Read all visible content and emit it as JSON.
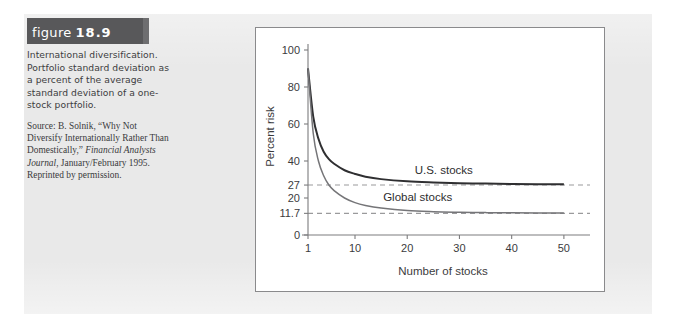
{
  "figure": {
    "banner_word": "figure",
    "banner_number": "18.9",
    "caption": "International diversification. Portfolio standard deviation as a percent of the average standard deviation of a one-stock portfolio.",
    "source_prefix": "Source: B. Solnik, “Why Not Diversify Internationally Rather Than Domestically,” ",
    "source_italic": "Financial Analysts Journal",
    "source_suffix": ", January/February 1995. Reprinted by permission."
  },
  "chart_data": {
    "type": "line",
    "title": "",
    "xlabel": "Number of stocks",
    "ylabel": "Percent risk",
    "xlim": [
      1,
      55
    ],
    "ylim": [
      0,
      100
    ],
    "xticks": [
      1,
      10,
      20,
      30,
      40,
      50
    ],
    "xticklabels": [
      "1",
      "10",
      "20",
      "30",
      "40",
      "50"
    ],
    "yticks": [
      0,
      11.7,
      20,
      27,
      40,
      60,
      80,
      100
    ],
    "yticklabels": [
      "0",
      "11.7",
      "20",
      "27",
      "40",
      "60",
      "80",
      "100"
    ],
    "grid": false,
    "legend_position": "inline-annotation",
    "reference_lines": [
      {
        "name": "us-asymptote",
        "value": 27,
        "style": "dashed",
        "color": "#9a9a9c"
      },
      {
        "name": "global-asymptote",
        "value": 11.7,
        "style": "dashed",
        "color": "#9a9a9c"
      }
    ],
    "annotations": [
      {
        "name": "us-stocks-label",
        "text": "U.S. stocks",
        "x": 27,
        "y": 33
      },
      {
        "name": "global-stocks-label",
        "text": "Global stocks",
        "x": 22,
        "y": 18.5
      }
    ],
    "series": [
      {
        "name": "U.S. stocks",
        "color": "#2f2f31",
        "asymptote": 27,
        "x": [
          1,
          2,
          3,
          4,
          5,
          6,
          8,
          10,
          12,
          15,
          20,
          25,
          30,
          35,
          40,
          45,
          50
        ],
        "values": [
          90,
          64,
          52,
          45,
          41,
          38.5,
          35,
          33,
          31.5,
          30.2,
          29.0,
          28.4,
          28.0,
          27.8,
          27.6,
          27.5,
          27.4
        ]
      },
      {
        "name": "Global stocks",
        "color": "#757578",
        "asymptote": 11.7,
        "x": [
          1,
          2,
          3,
          4,
          5,
          6,
          8,
          10,
          12,
          15,
          20,
          25,
          30,
          35,
          40,
          45,
          50
        ],
        "values": [
          90,
          55,
          40,
          32,
          27,
          24,
          20,
          17.5,
          16,
          14.6,
          13.2,
          12.6,
          12.3,
          12.1,
          12.0,
          11.9,
          11.85
        ]
      }
    ]
  }
}
